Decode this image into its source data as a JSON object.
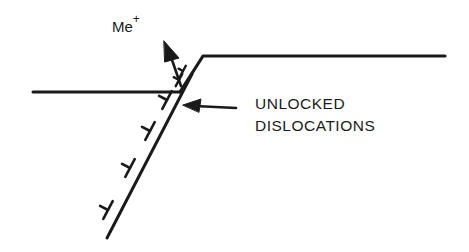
{
  "diagram": {
    "labels": {
      "ion": "Me",
      "ion_charge": "+",
      "callout_line1": "UNLOCKED",
      "callout_line2": "DISLOCATIONS"
    },
    "colors": {
      "stroke": "#1a1a1a",
      "background": "#ffffff"
    },
    "elements": {
      "surface_left": {
        "x1": 33,
        "y1": 92,
        "x2": 180,
        "y2": 92
      },
      "step_riser": {
        "x1": 180,
        "y1": 92,
        "x2": 203,
        "y2": 56
      },
      "surface_top": {
        "x1": 203,
        "y1": 56,
        "x2": 445,
        "y2": 56
      },
      "slip_plane": {
        "x1": 108,
        "y1": 237,
        "x2": 203,
        "y2": 56
      },
      "ion_arrow": {
        "from": [
          180,
          84
        ],
        "to": [
          166,
          43
        ]
      },
      "callout_arrow": {
        "from": [
          236,
          108
        ],
        "to": [
          183,
          106
        ]
      },
      "dislocation_count": 6
    }
  }
}
